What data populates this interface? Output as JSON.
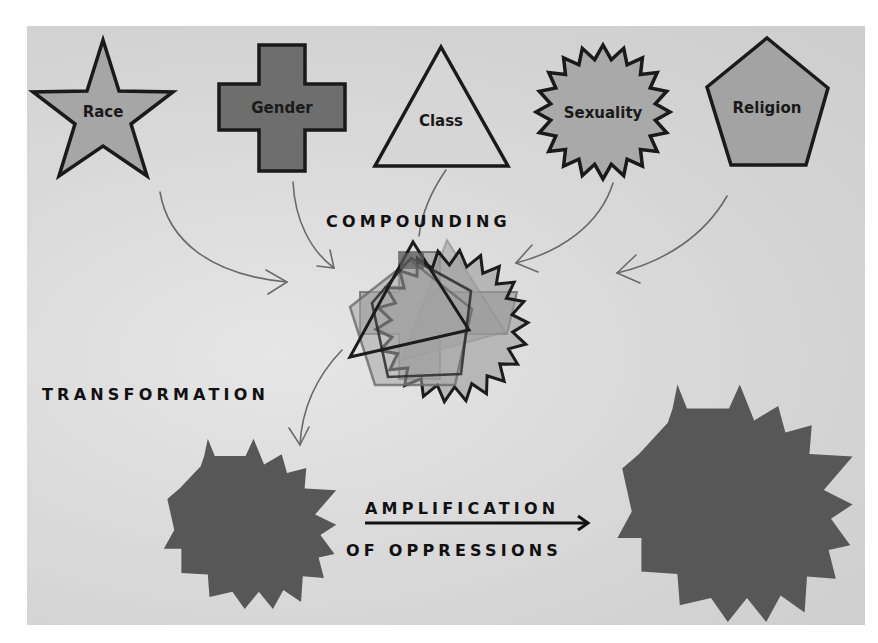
{
  "diagram": {
    "colors": {
      "background": "#d8d8d8",
      "outline": "#1a1a1a",
      "light_fill": "#d9d9d9",
      "medium_fill": "#a8a8a8",
      "dark_fill": "#6d6d6d",
      "result_fill": "#575757",
      "arrow": "#6a6a6a"
    },
    "categories": [
      {
        "id": "race",
        "label": "Race",
        "shape": "star",
        "fill": "#a6a6a6"
      },
      {
        "id": "gender",
        "label": "Gender",
        "shape": "cross",
        "fill": "#6e6e6e"
      },
      {
        "id": "class",
        "label": "Class",
        "shape": "triangle",
        "fill": "#d6d6d6"
      },
      {
        "id": "sexuality",
        "label": "Sexuality",
        "shape": "starburst",
        "fill": "#a9a9a9"
      },
      {
        "id": "religion",
        "label": "Religion",
        "shape": "pentagon",
        "fill": "#a3a3a3"
      }
    ],
    "stages": {
      "compounding": "COMPOUNDING",
      "transformation": "TRANSFORMATION",
      "amplification_line1": "AMPLIFICATION",
      "amplification_line2": "OF OPPRESSIONS"
    }
  }
}
